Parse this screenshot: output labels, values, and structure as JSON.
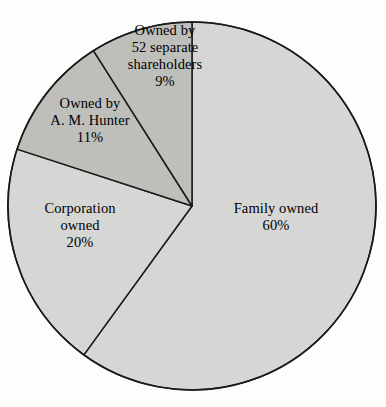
{
  "chart_data": {
    "type": "pie",
    "title": "",
    "subtitle": "",
    "xlabel": "",
    "ylabel": "",
    "legend": "none",
    "grid": false,
    "unit": "%",
    "start_angle_deg": 0,
    "direction": "clockwise",
    "categories": [
      "Family owned",
      "Corporation owned",
      "Owned by A. M. Hunter",
      "Owned by 52 separate shareholders"
    ],
    "values": [
      60,
      20,
      11,
      9
    ],
    "slices": [
      {
        "key": "family",
        "label_lines": [
          "Family owned"
        ],
        "value_label": "60%",
        "value": 60,
        "fill": "#d6d6d4",
        "stroke": "#1a1a1a",
        "start_deg": 0,
        "end_deg": 216
      },
      {
        "key": "corporation",
        "label_lines": [
          "Corporation",
          "owned"
        ],
        "value_label": "20%",
        "value": 20,
        "fill": "#d6d6d4",
        "stroke": "#1a1a1a",
        "start_deg": 216,
        "end_deg": 288
      },
      {
        "key": "hunter",
        "label_lines": [
          "Owned by",
          "A. M. Hunter"
        ],
        "value_label": "11%",
        "value": 11,
        "fill": "#bebebb",
        "stroke": "#1a1a1a",
        "start_deg": 288,
        "end_deg": 327.6
      },
      {
        "key": "shareholders",
        "label_lines": [
          "Owned by",
          "52 separate",
          "shareholders"
        ],
        "value_label": "9%",
        "value": 9,
        "fill": "#bebebb",
        "stroke": "#1a1a1a",
        "start_deg": 327.6,
        "end_deg": 360
      }
    ],
    "geometry": {
      "center_x": 192,
      "center_y": 206,
      "radius": 184
    },
    "colors": {
      "background": "#fdfdfc",
      "light_slice": "#d6d6d4",
      "dark_slice": "#bebebb",
      "outline": "#1a1a1a",
      "text": "#000000"
    }
  },
  "labels": {
    "family": {
      "line1": "Family owned",
      "value": "60%"
    },
    "corporation": {
      "line1": "Corporation",
      "line2": "owned",
      "value": "20%"
    },
    "hunter": {
      "line1": "Owned by",
      "line2": "A. M. Hunter",
      "value": "11%"
    },
    "shareholders": {
      "line1": "Owned by",
      "line2": "52 separate",
      "line3": "shareholders",
      "value": "9%"
    }
  }
}
